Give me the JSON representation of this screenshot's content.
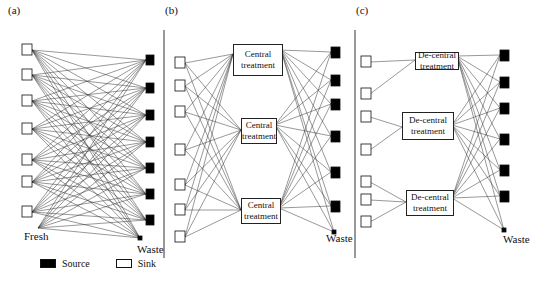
{
  "panels": [
    {
      "label": "(a)",
      "fresh_label": "Fresh",
      "waste_label": "Waste"
    },
    {
      "label": "(b)",
      "treatments": [
        "Central treatment",
        "Central treatment",
        "Central treatment"
      ],
      "waste_label": "Waste"
    },
    {
      "label": "(c)",
      "treatments": [
        "De-central treatment",
        "De-central treatment",
        "De-central treatment"
      ],
      "waste_label": "Waste"
    }
  ],
  "legend": {
    "source": "Source",
    "sink": "Sink"
  },
  "colors": {
    "line": "#333333",
    "source": "#000000",
    "sink": "#ffffff"
  }
}
